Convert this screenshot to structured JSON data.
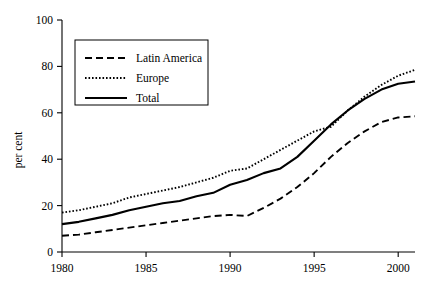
{
  "chart_data": {
    "type": "line",
    "title": "",
    "xlabel": "",
    "ylabel": "per cent",
    "xlim": [
      1980,
      2001
    ],
    "ylim": [
      0,
      100
    ],
    "grid": false,
    "legend_position": "top-left-inside",
    "xticks": [
      1980,
      1985,
      1990,
      1995,
      2000
    ],
    "xtick_labels": [
      "1980",
      "1985",
      "1990",
      "1995",
      "2000"
    ],
    "yticks": [
      0,
      20,
      40,
      60,
      80,
      100
    ],
    "ytick_labels": [
      "0",
      "20",
      "40",
      "60",
      "80",
      "100"
    ],
    "x": [
      1980,
      1981,
      1982,
      1983,
      1984,
      1985,
      1986,
      1987,
      1988,
      1989,
      1990,
      1991,
      1992,
      1993,
      1994,
      1995,
      1996,
      1997,
      1998,
      1999,
      2000,
      2001
    ],
    "series": [
      {
        "name": "Latin America",
        "style": "dashed",
        "color": "#000000",
        "values": [
          7,
          7.5,
          8.5,
          9.5,
          10.5,
          11.5,
          12.5,
          13.5,
          14.5,
          15.5,
          16,
          15.5,
          19,
          23,
          28,
          34,
          41,
          47,
          52,
          56,
          58,
          58.5
        ]
      },
      {
        "name": "Europe",
        "style": "dotted",
        "color": "#000000",
        "values": [
          17,
          18,
          19.5,
          21,
          23.5,
          25,
          26.5,
          28,
          30,
          32,
          35,
          36,
          40,
          44,
          48,
          52,
          54,
          61,
          67,
          72,
          76,
          78.5
        ]
      },
      {
        "name": "Total",
        "style": "solid",
        "color": "#000000",
        "values": [
          12,
          13,
          14.5,
          16,
          18,
          19.5,
          21,
          22,
          24,
          25.5,
          29,
          31,
          34,
          36,
          41,
          48,
          55,
          61,
          66,
          70,
          72.5,
          73.5
        ]
      }
    ]
  },
  "legend": {
    "items": [
      {
        "label": "Latin America",
        "style": "dashed"
      },
      {
        "label": "Europe",
        "style": "dotted"
      },
      {
        "label": "Total",
        "style": "solid"
      }
    ]
  }
}
